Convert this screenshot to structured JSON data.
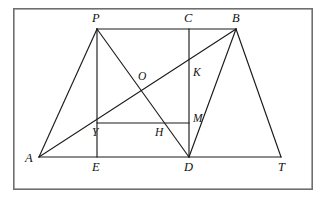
{
  "figure": {
    "canvas": {
      "width": 327,
      "height": 203
    },
    "frame": {
      "x": 13,
      "y": 8,
      "width": 300,
      "height": 182,
      "color": "#6f6f6f"
    },
    "stroke_color": "#1b1b1b",
    "background_color": "#ffffff",
    "points": {
      "A": {
        "x": 39,
        "y": 157,
        "label": "A",
        "label_x": 25,
        "label_y": 162
      },
      "E": {
        "x": 97,
        "y": 157,
        "label": "E",
        "label_x": 92,
        "label_y": 171
      },
      "D": {
        "x": 189,
        "y": 157,
        "label": "D",
        "label_x": 184,
        "label_y": 171
      },
      "T": {
        "x": 281,
        "y": 157,
        "label": "T",
        "label_x": 278,
        "label_y": 171
      },
      "P": {
        "x": 97,
        "y": 29,
        "label": "P",
        "label_x": 92,
        "label_y": 22
      },
      "C": {
        "x": 189,
        "y": 29,
        "label": "C",
        "label_x": 184,
        "label_y": 22
      },
      "B": {
        "x": 236,
        "y": 29,
        "label": "B",
        "label_x": 232,
        "label_y": 22
      },
      "O": {
        "x": 144,
        "y": 85,
        "label": "O",
        "label_x": 138,
        "label_y": 80
      },
      "K": {
        "x": 189,
        "y": 68,
        "label": "K",
        "label_x": 193,
        "label_y": 76
      },
      "M": {
        "x": 189,
        "y": 123,
        "label": "M",
        "label_x": 193,
        "label_y": 122
      },
      "H": {
        "x": 165,
        "y": 123,
        "label": "H",
        "label_x": 155,
        "label_y": 136
      },
      "Y": {
        "x": 97,
        "y": 123,
        "label": "Y",
        "label_x": 92,
        "label_y": 136
      }
    },
    "segments": [
      {
        "name": "segment-A-T",
        "x1": 39,
        "y1": 157,
        "x2": 281,
        "y2": 157
      },
      {
        "name": "segment-P-B",
        "x1": 97,
        "y1": 29,
        "x2": 236,
        "y2": 29
      },
      {
        "name": "segment-A-P",
        "x1": 39,
        "y1": 157,
        "x2": 97,
        "y2": 29
      },
      {
        "name": "segment-A-B",
        "x1": 39,
        "y1": 157,
        "x2": 236,
        "y2": 29
      },
      {
        "name": "segment-P-D",
        "x1": 97,
        "y1": 29,
        "x2": 189,
        "y2": 157
      },
      {
        "name": "segment-P-E",
        "x1": 97,
        "y1": 29,
        "x2": 97,
        "y2": 157
      },
      {
        "name": "segment-C-D",
        "x1": 189,
        "y1": 29,
        "x2": 189,
        "y2": 157
      },
      {
        "name": "segment-B-D",
        "x1": 236,
        "y1": 29,
        "x2": 189,
        "y2": 157
      },
      {
        "name": "segment-B-T",
        "x1": 236,
        "y1": 29,
        "x2": 281,
        "y2": 157
      },
      {
        "name": "segment-Y-M",
        "x1": 97,
        "y1": 123,
        "x2": 189,
        "y2": 123
      }
    ],
    "label_order": [
      "P",
      "C",
      "B",
      "O",
      "K",
      "M",
      "H",
      "Y",
      "A",
      "E",
      "D",
      "T"
    ]
  }
}
